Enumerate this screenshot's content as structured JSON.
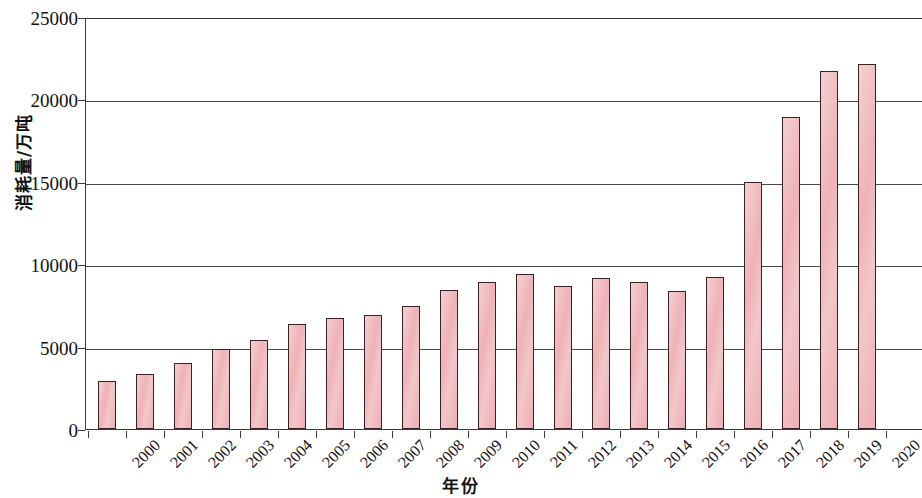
{
  "chart_data": {
    "type": "bar",
    "title": "",
    "xlabel": "年份",
    "ylabel": "消耗量/万吨",
    "ylim": [
      0,
      25000
    ],
    "y_ticks": [
      0,
      5000,
      10000,
      15000,
      20000,
      25000
    ],
    "y_tick_labels": [
      "0",
      "5000",
      "10000",
      "15000",
      "20000",
      "25000"
    ],
    "grid": "horizontal",
    "legend": "none",
    "bar_color": "#edaeb3",
    "bar_edge_color": "#3a2224",
    "categories": [
      "2000",
      "2001",
      "2002",
      "2003",
      "2004",
      "2005",
      "2006",
      "2007",
      "2008",
      "2009",
      "2010",
      "2011",
      "2012",
      "2013",
      "2014",
      "2015",
      "2016",
      "2017",
      "2018",
      "2019",
      "2020"
    ],
    "values": [
      2900,
      3350,
      4000,
      4850,
      5400,
      6350,
      6750,
      6900,
      7450,
      8450,
      8900,
      9400,
      8650,
      9150,
      8950,
      8400,
      9200,
      15000,
      18950,
      21750,
      22150
    ]
  }
}
